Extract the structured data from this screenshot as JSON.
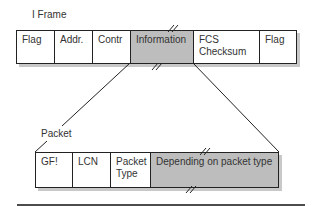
{
  "diagram": {
    "iframe_label": "I Frame",
    "packet_label": "Packet",
    "iframe_fields": [
      {
        "label": "Flag",
        "width": 38,
        "highlight": false
      },
      {
        "label": "Addr.",
        "width": 38,
        "highlight": false
      },
      {
        "label": "Contr",
        "width": 38,
        "highlight": false
      },
      {
        "label": "Information",
        "width": 63,
        "highlight": true
      },
      {
        "label": "FCS Checksum",
        "width": 66,
        "highlight": false
      },
      {
        "label": "Flag",
        "width": 38,
        "highlight": false
      }
    ],
    "packet_fields": [
      {
        "label": "GF!",
        "width": 37,
        "highlight": false
      },
      {
        "label": "LCN",
        "width": 38,
        "highlight": false
      },
      {
        "label": "Packet Type",
        "width": 40,
        "highlight": false
      },
      {
        "label": "Depending on packet type",
        "width": 129,
        "highlight": true
      }
    ],
    "colors": {
      "highlight": "#bdbdbd",
      "border": "#222222",
      "shadow": "#c8c8c8"
    }
  }
}
